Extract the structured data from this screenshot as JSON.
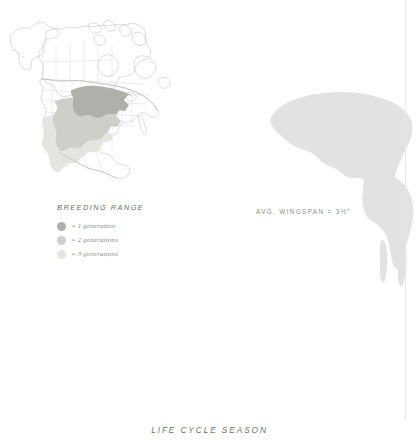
{
  "caption": "LIFE CYCLE SEASON",
  "map": {
    "title": "breeding-range-map",
    "region": "North America",
    "outline_color": "#b9b9b9",
    "border_color": "#c9c9c9"
  },
  "legend": {
    "title": "BREEDING RANGE",
    "items": [
      {
        "label": "= 1 generation",
        "color": "#b0b0ab",
        "generations": 1
      },
      {
        "label": "= 2 generations",
        "color": "#cfcfca",
        "generations": 2
      },
      {
        "label": "= 3 generations",
        "color": "#e4e4e0",
        "generations": 3
      }
    ]
  },
  "wingspan": {
    "text": "AVG. WINGSPAN = 3½\""
  },
  "butterfly": {
    "name": "butterfly-wing-silhouette",
    "fill": "#e2e2e2",
    "antenna_color": "#e8e8e8"
  }
}
